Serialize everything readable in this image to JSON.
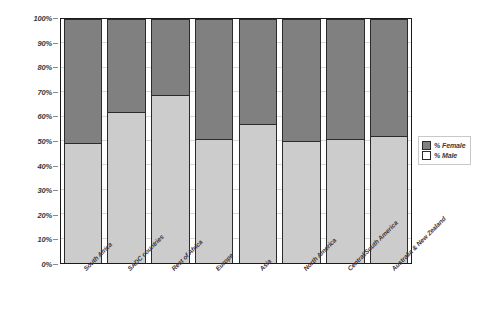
{
  "chart_data": {
    "type": "bar",
    "title": "",
    "subtitle": "",
    "xlabel": "",
    "ylabel": "",
    "stacked": true,
    "stack_mode": "100%",
    "grid": true,
    "legend_position": "right",
    "ylim": [
      0,
      100
    ],
    "categories": [
      "South Africa",
      "SADC countries",
      "Rest of Africa",
      "Europe",
      "Asia",
      "North America",
      "Central/South America",
      "Australia & New Zealand"
    ],
    "series": [
      {
        "name": "% Male",
        "color": "#cccccc",
        "values": [
          49,
          62,
          69,
          51,
          57,
          50,
          51,
          52
        ]
      },
      {
        "name": "% Female",
        "color": "#808080",
        "values": [
          51,
          38,
          31,
          49,
          43,
          50,
          49,
          48
        ]
      }
    ],
    "y_ticks": [
      "0%",
      "10%",
      "20%",
      "30%",
      "40%",
      "50%",
      "60%",
      "70%",
      "80%",
      "90%",
      "100%"
    ],
    "y_tick_values": [
      0,
      10,
      20,
      30,
      40,
      50,
      60,
      70,
      80,
      90,
      100
    ]
  },
  "legend": {
    "entries": [
      {
        "label": "% Female",
        "swatch": "dark-gray"
      },
      {
        "label": "% Male",
        "swatch": "light-gray"
      }
    ]
  },
  "colors": {
    "female": "#808080",
    "male": "#cccccc",
    "axis": "#1a1a1a",
    "grid": "#d8d8d8",
    "text": "#3a3a3a"
  }
}
